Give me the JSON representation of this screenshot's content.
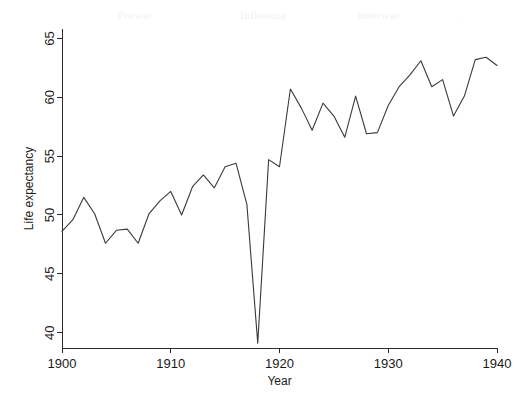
{
  "figure": {
    "background_color": "#ffffff",
    "line_color": "#3a3a3a",
    "axis_color": "#2a2a2a",
    "ghost_text": {
      "word1": "Prewar",
      "word2": "Influenza",
      "word3": "Interwar",
      "word4": "."
    }
  },
  "chart_data": {
    "type": "line",
    "title": "",
    "xlabel": "Year",
    "ylabel": "Life expectancy",
    "xlim": [
      1900,
      1940
    ],
    "ylim": [
      38.7,
      65.8
    ],
    "grid": false,
    "legend": null,
    "xticks": [
      1900,
      1910,
      1920,
      1930,
      1940
    ],
    "xtick_labels": [
      "1900",
      "1910",
      "1920",
      "1930",
      "1940"
    ],
    "yticks": [
      40,
      45,
      50,
      55,
      60,
      65
    ],
    "ytick_labels": [
      "40",
      "45",
      "50",
      "55",
      "60",
      "65"
    ],
    "x": [
      1900,
      1901,
      1902,
      1903,
      1904,
      1905,
      1906,
      1907,
      1908,
      1909,
      1910,
      1911,
      1912,
      1913,
      1914,
      1915,
      1916,
      1917,
      1918,
      1919,
      1920,
      1921,
      1922,
      1923,
      1924,
      1925,
      1926,
      1927,
      1928,
      1929,
      1930,
      1931,
      1932,
      1933,
      1934,
      1935,
      1936,
      1937,
      1938,
      1939,
      1940
    ],
    "values": [
      48.6,
      49.6,
      51.5,
      50.1,
      47.6,
      48.7,
      48.8,
      47.6,
      50.1,
      51.2,
      52.0,
      50.0,
      52.4,
      53.4,
      52.3,
      54.1,
      54.4,
      50.9,
      39.1,
      54.7,
      54.1,
      60.7,
      59.1,
      57.2,
      59.5,
      58.4,
      56.6,
      60.1,
      56.9,
      57.0,
      59.3,
      60.9,
      61.9,
      63.1,
      60.9,
      61.5,
      58.4,
      60.1,
      63.2,
      63.4,
      62.7
    ],
    "annotations": []
  }
}
